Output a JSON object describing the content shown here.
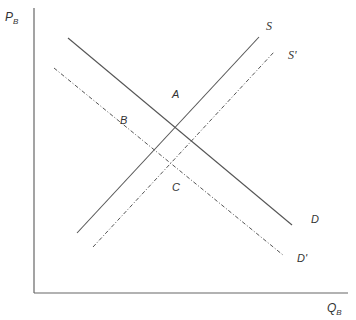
{
  "diagram": {
    "type": "supply-demand",
    "axes": {
      "y_label": "P",
      "y_label_sub": "B",
      "x_label": "Q",
      "x_label_sub": "B"
    },
    "curves": [
      {
        "name": "S",
        "label": "S",
        "style": "solid",
        "x1": 77,
        "y1": 233,
        "x2": 259,
        "y2": 37
      },
      {
        "name": "S'",
        "label": "S'",
        "style": "dash-dot",
        "x1": 93,
        "y1": 247,
        "x2": 274,
        "y2": 52
      },
      {
        "name": "D",
        "label": "D",
        "style": "solid",
        "x1": 68,
        "y1": 38,
        "x2": 292,
        "y2": 225
      },
      {
        "name": "D'",
        "label": "D'",
        "style": "dash-dot",
        "x1": 54,
        "y1": 68,
        "x2": 283,
        "y2": 255
      }
    ],
    "points": [
      {
        "label": "A"
      },
      {
        "label": "B"
      },
      {
        "label": "C"
      }
    ],
    "line_color": "#555555"
  }
}
